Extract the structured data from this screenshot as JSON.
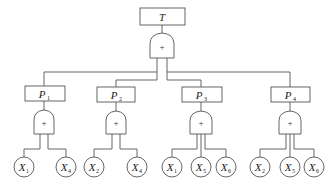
{
  "diagram": {
    "type": "fault-tree",
    "top_event": {
      "label": "T",
      "gate": "+"
    },
    "intermediate_events": [
      {
        "label": "P",
        "sub": "1",
        "gate": "+",
        "inputs": [
          {
            "label": "X",
            "sub": "1"
          },
          {
            "label": "X",
            "sub": "4"
          }
        ]
      },
      {
        "label": "P",
        "sub": "2",
        "gate": "+",
        "inputs": [
          {
            "label": "X",
            "sub": "2"
          },
          {
            "label": "X",
            "sub": "4"
          }
        ]
      },
      {
        "label": "P",
        "sub": "3",
        "gate": "+",
        "inputs": [
          {
            "label": "X",
            "sub": "1"
          },
          {
            "label": "X",
            "sub": "5"
          },
          {
            "label": "X",
            "sub": "6"
          }
        ]
      },
      {
        "label": "P",
        "sub": "4",
        "gate": "+",
        "inputs": [
          {
            "label": "X",
            "sub": "2"
          },
          {
            "label": "X",
            "sub": "5"
          },
          {
            "label": "X",
            "sub": "6"
          }
        ]
      }
    ]
  }
}
